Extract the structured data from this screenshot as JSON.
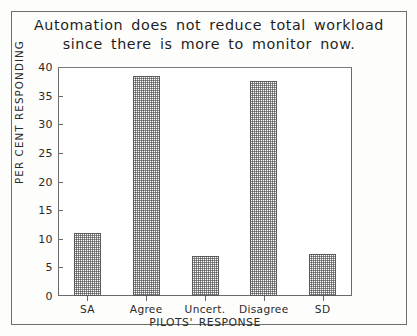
{
  "figure": {
    "title_line1": "Automation does not reduce total workload",
    "title_line2": "since there is more to monitor now.",
    "frame_color": "#6e6e6e",
    "bar_fill_color": "#8c8c8c",
    "bar_edge_color": "#5a5a5a",
    "background": "#ffffff"
  },
  "chart_data": {
    "type": "bar",
    "title": "Automation does not reduce total workload since there is more to monitor now.",
    "categories": [
      "SA",
      "Agree",
      "Uncert.",
      "Disagree",
      "SD"
    ],
    "values": [
      11,
      38.5,
      7,
      37.5,
      7.3
    ],
    "xlabel": "PILOTS' RESPONSE",
    "ylabel": "PER CENT RESPONDING",
    "ylim": [
      0,
      40
    ],
    "ytick_labels": [
      "0",
      "5",
      "10",
      "15",
      "20",
      "25",
      "30",
      "35",
      "40"
    ],
    "ytick_values": [
      0,
      5,
      10,
      15,
      20,
      25,
      30,
      35,
      40
    ],
    "grid": false,
    "legend": null,
    "bar_pattern": "checkerboard-dither"
  }
}
